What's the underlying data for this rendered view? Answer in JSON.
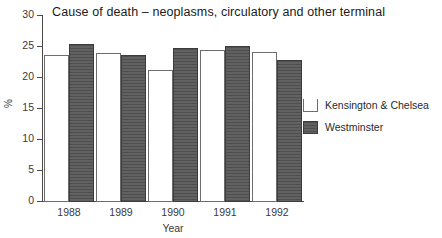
{
  "chart_data": {
    "type": "bar",
    "title": "Cause of death – neoplasms, circulatory and other terminal",
    "xlabel": "Year",
    "ylabel": "%",
    "categories": [
      "1988",
      "1989",
      "1990",
      "1991",
      "1992"
    ],
    "ylim": [
      0,
      30
    ],
    "yticks": [
      0,
      5,
      10,
      15,
      20,
      25,
      30
    ],
    "ytick_labels": [
      "0",
      "5",
      "10",
      "15",
      "20",
      "25",
      "30"
    ],
    "grid": false,
    "legend_position": "right",
    "series": [
      {
        "name": "Kensington & Chelsea",
        "color": "#ffffff",
        "edge_color": "#6d6d6d",
        "values": [
          23.6,
          23.9,
          21.2,
          24.3,
          24.1
        ]
      },
      {
        "name": "Westminster",
        "color": "#585858",
        "edge_color": "#3c3c3c",
        "values": [
          25.4,
          23.6,
          24.7,
          25.0,
          22.8
        ]
      }
    ]
  }
}
